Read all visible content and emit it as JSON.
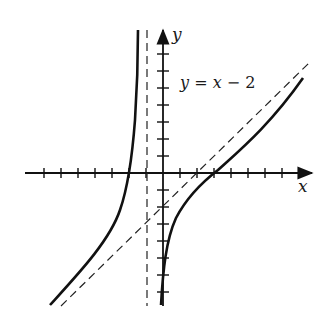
{
  "figure": {
    "x_axis_label": "x",
    "y_axis_label": "y",
    "asymptote_label": "y = x − 2"
  },
  "colors": {
    "ink": "#111111",
    "background": "#ffffff"
  },
  "chart_data": {
    "type": "line",
    "title": "",
    "xlabel": "x",
    "ylabel": "y",
    "xlim": [
      -8,
      8.5
    ],
    "ylim": [
      -7.8,
      8.5
    ],
    "grid": false,
    "x_ticks": [
      -7,
      -6,
      -5,
      -4,
      -3,
      -2,
      -1,
      1,
      2,
      3,
      4,
      5,
      6,
      7
    ],
    "y_ticks": [
      -7,
      -6,
      -5,
      -4,
      -3,
      -2,
      -1,
      1,
      2,
      3,
      4,
      5,
      6,
      7
    ],
    "tick_labels_shown": false,
    "series": [
      {
        "name": "curve (left branch)",
        "style": "solid",
        "description": "Left branch of rational function with vertical asymptote x = -1 and oblique asymptote y = x - 2",
        "x": [
          -6.4,
          -5,
          -4,
          -3,
          -2,
          -1.5,
          -1.25,
          -1.1,
          -1.05
        ],
        "y": [
          -7.8,
          -6.5,
          -5.3,
          -3.9,
          -0.0,
          2.5,
          6.5,
          8.5,
          8.5
        ]
      },
      {
        "name": "curve (right branch)",
        "style": "solid",
        "x": [
          -0.05,
          0,
          0.5,
          1,
          2,
          3,
          4,
          5,
          6,
          7,
          8.4
        ],
        "y": [
          -7.7,
          -7.0,
          -3.8,
          -2.2,
          -0.9,
          0.0,
          1.2,
          2.3,
          3.4,
          4.5,
          5.7
        ]
      },
      {
        "name": "y = x − 2",
        "style": "dashed",
        "x": [
          -5.6,
          8.6
        ],
        "y": [
          -7.6,
          6.6
        ]
      },
      {
        "name": "x = -1",
        "style": "dashed",
        "x": [
          -1,
          -1
        ],
        "y": [
          -7.8,
          8.5
        ]
      }
    ],
    "annotations": [
      {
        "text": "y = x − 2",
        "x": 1.0,
        "y": 5.2
      }
    ]
  }
}
